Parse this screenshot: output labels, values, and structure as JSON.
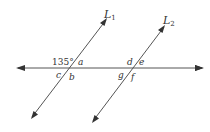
{
  "diagram": {
    "lines": [
      {
        "name": "L1",
        "label": "L",
        "subscript": "1"
      },
      {
        "name": "L2",
        "label": "L",
        "subscript": "2"
      },
      {
        "name": "transversal",
        "label": ""
      }
    ],
    "angle_given": "135°",
    "angle_labels": {
      "a": "a",
      "b": "b",
      "c": "c",
      "d": "d",
      "e": "e",
      "f": "f",
      "g": "g"
    },
    "colors": {
      "line": "#555555",
      "text": "#333333",
      "background": "#ffffff"
    }
  }
}
